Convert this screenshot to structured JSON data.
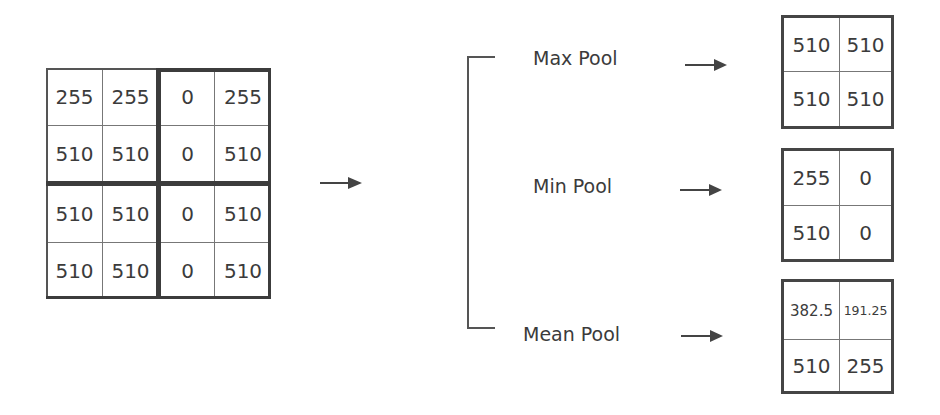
{
  "input_matrix": {
    "rows": [
      [
        "255",
        "255",
        "0",
        "255"
      ],
      [
        "510",
        "510",
        "0",
        "510"
      ],
      [
        "510",
        "510",
        "0",
        "510"
      ],
      [
        "510",
        "510",
        "0",
        "510"
      ]
    ]
  },
  "operations": [
    {
      "label": "Max Pool",
      "output": [
        [
          "510",
          "510"
        ],
        [
          "510",
          "510"
        ]
      ]
    },
    {
      "label": "Min Pool",
      "output": [
        [
          "255",
          "0"
        ],
        [
          "510",
          "0"
        ]
      ]
    },
    {
      "label": "Mean Pool",
      "output": [
        [
          "382.5",
          "191.25"
        ],
        [
          "510",
          "255"
        ]
      ]
    }
  ],
  "colors": {
    "line": "#3c3c3c",
    "text": "#3b3b3b",
    "background": "#ffffff"
  },
  "icons": {
    "main_arrow": "right-arrow-icon",
    "op_arrow": "right-arrow-icon"
  }
}
